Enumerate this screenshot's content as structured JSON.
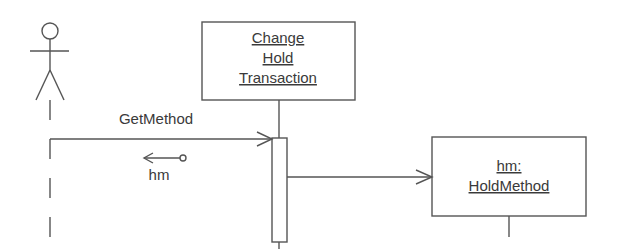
{
  "diagram": {
    "type": "UML sequence diagram",
    "actor": {
      "name": "actor"
    },
    "objects": [
      {
        "id": "change-hold-transaction",
        "lines": [
          "Change",
          "Hold",
          "Transaction"
        ],
        "underlined": true
      },
      {
        "id": "hold-method",
        "lines": [
          "hm:",
          "HoldMethod"
        ],
        "underlined": true
      }
    ],
    "messages": [
      {
        "id": "get-method",
        "label": "GetMethod",
        "from": "actor",
        "to": "change-hold-transaction"
      },
      {
        "id": "create-hold-method",
        "label": "",
        "from": "change-hold-transaction",
        "to": "hold-method"
      }
    ],
    "return_values": [
      {
        "id": "hm-return",
        "label": "hm",
        "direction": "left"
      }
    ]
  }
}
